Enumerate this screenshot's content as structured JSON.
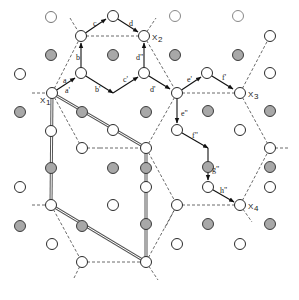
{
  "figure": {
    "type": "lattice-diagram",
    "colors": {
      "open_fill": "#ffffff",
      "filled_fill": "#a8a8a8",
      "stroke": "#2a2a2a",
      "dashed": "#444444",
      "double_line": "#555555",
      "arrow": "#111111"
    },
    "labels": {
      "X1": "X",
      "X1_sub": "1",
      "X2": "X",
      "X2_sub": "2",
      "X3": "X",
      "X3_sub": "3",
      "X4": "X",
      "X4_sub": "4",
      "a": "a",
      "a_prime": "a'",
      "b": "b",
      "b_prime": "b'",
      "c": "c",
      "c_prime": "c'",
      "d": "d",
      "d_prime": "d'",
      "d_dprime": "d\"",
      "e_prime": "e'",
      "e_dprime": "e\"",
      "f_prime": "f'",
      "f_dprime": "f\"",
      "g_dprime": "g\"",
      "h_dprime": "h\""
    },
    "open_nodes": [
      [
        51,
        17
      ],
      [
        113,
        16
      ],
      [
        175,
        16
      ],
      [
        238,
        16
      ],
      [
        81,
        36
      ],
      [
        144,
        36
      ],
      [
        270,
        36
      ],
      [
        20,
        74
      ],
      [
        81,
        73
      ],
      [
        144,
        73
      ],
      [
        207,
        73
      ],
      [
        270,
        73
      ],
      [
        52,
        93
      ],
      [
        177,
        93
      ],
      [
        240,
        93
      ],
      [
        51,
        131
      ],
      [
        113,
        130
      ],
      [
        177,
        130
      ],
      [
        240,
        130
      ],
      [
        82,
        148
      ],
      [
        146,
        148
      ],
      [
        270,
        148
      ],
      [
        20,
        187
      ],
      [
        82,
        187
      ],
      [
        146,
        187
      ],
      [
        207,
        187
      ],
      [
        240,
        187
      ],
      [
        51,
        205
      ],
      [
        113,
        207
      ],
      [
        82,
        226
      ],
      [
        146,
        226
      ],
      [
        177,
        205
      ],
      [
        51,
        244
      ],
      [
        146,
        244
      ]
    ],
    "filled_nodes": [
      [
        52,
        55
      ],
      [
        113,
        55
      ],
      [
        175,
        55
      ],
      [
        238,
        55
      ],
      [
        20,
        112
      ],
      [
        82,
        111
      ],
      [
        146,
        111
      ],
      [
        208,
        111
      ],
      [
        270,
        111
      ],
      [
        51,
        168
      ],
      [
        113,
        168
      ],
      [
        177,
        168
      ],
      [
        240,
        168
      ],
      [
        20,
        226
      ],
      [
        208,
        226
      ],
      [
        270,
        226
      ],
      [
        82,
        187
      ],
      [
        146,
        206
      ]
    ]
  }
}
